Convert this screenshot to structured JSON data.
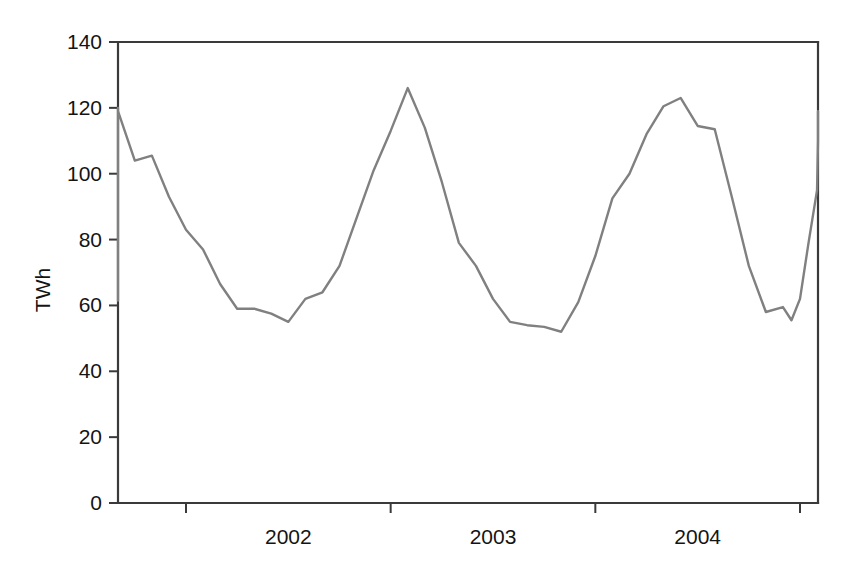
{
  "chart_data": {
    "type": "line",
    "title": "",
    "xlabel": "",
    "ylabel": "TWh",
    "ylim": [
      0,
      140
    ],
    "yticks": [
      0,
      20,
      40,
      60,
      80,
      100,
      120,
      140
    ],
    "ytick_labels": [
      "0",
      "20",
      "40",
      "60",
      "80",
      "100",
      "120",
      "140"
    ],
    "xtick_labels": [
      "2002",
      "2003",
      "2004"
    ],
    "xtick_positions": [
      2002,
      2003,
      2004
    ],
    "xlim": [
      2001.25,
      2005.0
    ],
    "x_axis_tick_years": [
      2002,
      2003,
      2004,
      2005
    ],
    "grid": false,
    "legend": "none",
    "line_color": "#808080",
    "series": [
      {
        "name": "TWh",
        "x": [
          2001.25,
          2001.333,
          2001.417,
          2001.5,
          2001.583,
          2001.667,
          2001.75,
          2001.833,
          2001.917,
          2002.0,
          2002.083,
          2002.167,
          2002.25,
          2002.333,
          2002.417,
          2002.5,
          2002.583,
          2002.667,
          2002.75,
          2002.833,
          2002.917,
          2003.0,
          2003.083,
          2003.167,
          2003.25,
          2003.333,
          2003.417,
          2003.5,
          2003.583,
          2003.667,
          2003.75,
          2003.833,
          2003.917,
          2004.0,
          2004.083,
          2004.167,
          2004.25,
          2004.333,
          2004.417,
          2004.5,
          2004.583,
          2004.667,
          2004.75,
          2004.833,
          2004.917,
          2005.0
        ],
        "values": [
          61.5,
          71.0,
          86.5,
          104.0,
          120.0,
          119.0,
          104.0,
          105.5,
          93.0,
          83.0,
          77.0,
          66.5,
          59.0,
          59.0,
          57.5,
          55.0,
          62.0,
          64.0,
          72.0,
          86.5,
          101.0,
          113.0,
          126.0,
          114.0,
          97.5,
          79.0,
          72.0,
          62.0,
          55.0,
          54.0,
          53.5,
          52.0,
          61.0,
          75.0,
          92.5,
          100.0,
          112.0,
          120.5,
          123.0,
          114.5,
          113.5,
          93.0,
          72.0,
          58.0,
          59.5,
          55.5
        ],
        "note_values_extra": [
          62.0,
          79.0,
          95.0,
          110.0,
          119.0,
          113.0
        ]
      }
    ],
    "series_full_values": [
      61.5,
      71.0,
      86.5,
      104.0,
      120.0,
      119.0,
      104.0,
      105.5,
      93.0,
      83.0,
      77.0,
      66.5,
      59.0,
      59.0,
      57.5,
      55.0,
      62.0,
      64.0,
      72.0,
      86.5,
      101.0,
      113.0,
      126.0,
      114.0,
      97.5,
      79.0,
      72.0,
      62.0,
      55.0,
      54.0,
      53.5,
      52.0,
      61.0,
      75.0,
      92.5,
      100.0,
      112.0,
      120.5,
      123.0,
      114.5,
      113.5,
      93.0,
      72.0,
      58.0,
      59.5,
      55.5,
      62.0,
      79.0,
      95.0,
      110.0,
      119.0,
      113.0
    ],
    "series_full_x": [
      2001.25,
      2001.3333,
      2001.4167,
      2001.5,
      2001.5833,
      2001.6667,
      2001.75,
      2001.8333,
      2001.9167,
      2002.0,
      2002.0833,
      2002.1667,
      2002.25,
      2002.3333,
      2002.4167,
      2002.5,
      2002.5833,
      2002.6667,
      2002.75,
      2002.8333,
      2002.9167,
      2003.0,
      2003.0833,
      2003.1667,
      2003.25,
      2003.3333,
      2003.4167,
      2003.5,
      2003.5833,
      2003.6667,
      2003.75,
      2003.8333,
      2003.9167,
      2004.0,
      2004.0833,
      2004.1667,
      2004.25,
      2004.3333,
      2004.4167,
      2004.5,
      2004.5833,
      2004.6667,
      2004.75,
      2004.8333,
      2004.9167,
      2004.9583,
      2005.0,
      2005.0417,
      2005.0833,
      2005.125,
      2005.1667,
      2005.2083
    ]
  },
  "axis": {
    "y_title": "TWh"
  }
}
